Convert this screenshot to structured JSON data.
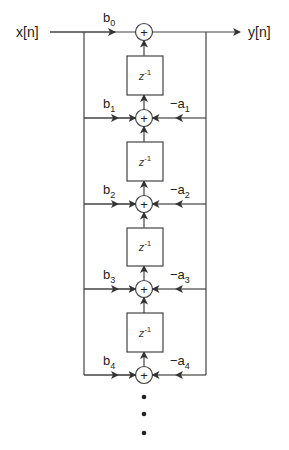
{
  "diagram": {
    "input_label": "x[n]",
    "output_label": "y[n]",
    "adder_symbol": "+",
    "delay_label": "z",
    "delay_exp": "-1",
    "feedforward": [
      {
        "base": "b",
        "sub": "0"
      },
      {
        "base": "b",
        "sub": "1"
      },
      {
        "base": "b",
        "sub": "2"
      },
      {
        "base": "b",
        "sub": "3"
      },
      {
        "base": "b",
        "sub": "4"
      }
    ],
    "feedback": [
      {
        "base": "−a",
        "sub": "1"
      },
      {
        "base": "−a",
        "sub": "2"
      },
      {
        "base": "−a",
        "sub": "3"
      },
      {
        "base": "−a",
        "sub": "4"
      }
    ],
    "continuation": "•••"
  }
}
